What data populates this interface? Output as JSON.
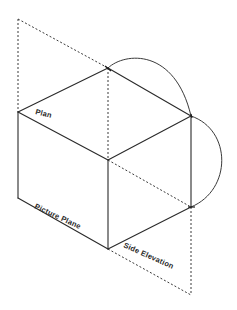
{
  "diagram": {
    "type": "isometric projection sketch",
    "labels": {
      "plan": "Plan",
      "picture_plane": "Picture Plane",
      "side_elevation": "Side Elevation"
    },
    "colors": {
      "line": "#2a2a2a",
      "background": "#ffffff"
    }
  }
}
